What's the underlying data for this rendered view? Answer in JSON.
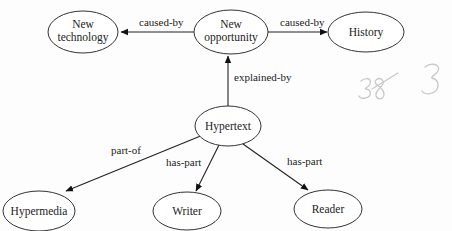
{
  "diagram": {
    "type": "concept-map",
    "nodes": [
      {
        "id": "new_technology",
        "lines": [
          "New",
          "technology"
        ]
      },
      {
        "id": "new_opportunity",
        "lines": [
          "New",
          "opportunity"
        ]
      },
      {
        "id": "history",
        "lines": [
          "History"
        ]
      },
      {
        "id": "hypertext",
        "lines": [
          "Hypertext"
        ]
      },
      {
        "id": "hypermedia",
        "lines": [
          "Hypermedia"
        ]
      },
      {
        "id": "writer",
        "lines": [
          "Writer"
        ]
      },
      {
        "id": "reader",
        "lines": [
          "Reader"
        ]
      }
    ],
    "edges": [
      {
        "from": "new_opportunity",
        "to": "new_technology",
        "label": "caused-by"
      },
      {
        "from": "new_opportunity",
        "to": "history",
        "label": "caused-by"
      },
      {
        "from": "hypertext",
        "to": "new_opportunity",
        "label": "explained-by"
      },
      {
        "from": "hypertext",
        "to": "hypermedia",
        "label": "part-of"
      },
      {
        "from": "hypertext",
        "to": "writer",
        "label": "has-part"
      },
      {
        "from": "hypertext",
        "to": "reader",
        "label": "has-part"
      }
    ],
    "annotation": {
      "handwritten": "38 3"
    }
  },
  "labels": {
    "new_technology_1": "New",
    "new_technology_2": "technology",
    "new_opportunity_1": "New",
    "new_opportunity_2": "opportunity",
    "history": "History",
    "hypertext": "Hypertext",
    "hypermedia": "Hypermedia",
    "writer": "Writer",
    "reader": "Reader",
    "edge_caused_by_left": "caused-by",
    "edge_caused_by_right": "caused-by",
    "edge_explained_by": "explained-by",
    "edge_part_of": "part-of",
    "edge_has_part_writer": "has-part",
    "edge_has_part_reader": "has-part"
  }
}
